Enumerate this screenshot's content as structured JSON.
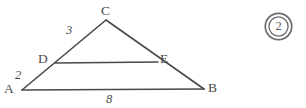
{
  "figure": {
    "type": "euclidean-geometry-diagram",
    "background_color": "#ffffff",
    "stroke_color": "#4a4a4a",
    "vertices": [
      {
        "id": "A",
        "label": "A",
        "x": 22,
        "y": 90
      },
      {
        "id": "B",
        "label": "B",
        "x": 204,
        "y": 89
      },
      {
        "id": "C",
        "label": "C",
        "x": 106,
        "y": 20
      },
      {
        "id": "D",
        "label": "D",
        "x": 55,
        "y": 63
      },
      {
        "id": "E",
        "label": "E",
        "x": 158,
        "y": 62
      }
    ],
    "segments": [
      {
        "id": "AB",
        "from": "A",
        "to": "B",
        "name": "base-segment-ab"
      },
      {
        "id": "AC",
        "from": "A",
        "to": "C",
        "name": "side-segment-ac"
      },
      {
        "id": "CB",
        "from": "C",
        "to": "B",
        "name": "side-segment-cb"
      },
      {
        "id": "DE",
        "from": "D",
        "to": "E",
        "name": "midsegment-de"
      }
    ],
    "length_labels": [
      {
        "id": "len-3",
        "segment": "DC",
        "value": "3"
      },
      {
        "id": "len-2",
        "segment": "AD",
        "value": "2"
      },
      {
        "id": "len-8",
        "segment": "AB",
        "value": "8"
      }
    ]
  },
  "marker": {
    "name": "circled-number-marker",
    "value": "2",
    "style": "double-circle",
    "color": "#6b6b6b"
  }
}
